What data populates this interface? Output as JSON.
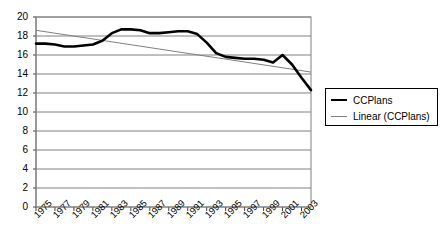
{
  "chart_data": {
    "type": "line",
    "title": "",
    "xlabel": "",
    "ylabel": "",
    "grid": true,
    "legend_position": "right",
    "xlim": [
      1975,
      2004
    ],
    "ylim": [
      0,
      20
    ],
    "ytick_step": 2,
    "yticks": [
      "20",
      "18",
      "16",
      "14",
      "12",
      "10",
      "8",
      "6",
      "4",
      "2",
      "0"
    ],
    "categories": [
      "1975",
      "1976",
      "1977",
      "1978",
      "1979",
      "1980",
      "1981",
      "1982",
      "1983",
      "1984",
      "1985",
      "1986",
      "1987",
      "1988",
      "1989",
      "1990",
      "1991",
      "1992",
      "1993",
      "1994",
      "1995",
      "1996",
      "1997",
      "1998",
      "1999",
      "2000",
      "2001",
      "2002",
      "2003",
      "2004"
    ],
    "xtick_labels": [
      "1975",
      "1977",
      "1979",
      "1981",
      "1983",
      "1985",
      "1987",
      "1989",
      "1991",
      "1993",
      "1995",
      "1997",
      "1999",
      "2001",
      "2003"
    ],
    "series": [
      {
        "name": "CCPlans",
        "color": "#000000",
        "width": 2.6,
        "values": [
          17.2,
          17.2,
          17.1,
          16.9,
          16.9,
          17.0,
          17.1,
          17.5,
          18.3,
          18.7,
          18.7,
          18.6,
          18.3,
          18.3,
          18.4,
          18.5,
          18.5,
          18.2,
          17.3,
          16.2,
          15.8,
          15.7,
          15.6,
          15.6,
          15.5,
          15.2,
          16.0,
          15.0,
          13.6,
          12.3
        ]
      },
      {
        "name": "Linear (CCPlans)",
        "color": "#808080",
        "width": 1.0,
        "trendline": true,
        "start_value": 18.6,
        "end_value": 14.2
      }
    ]
  },
  "legend": {
    "items": [
      {
        "label": "CCPlans",
        "style": "thick"
      },
      {
        "label": "Linear (CCPlans)",
        "style": "thin"
      }
    ]
  }
}
